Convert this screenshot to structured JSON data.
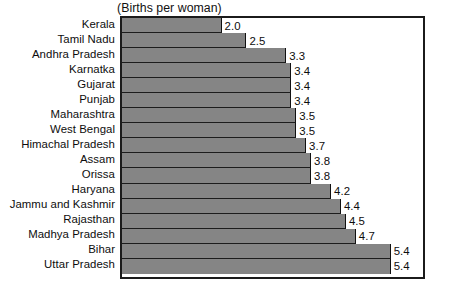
{
  "chart_data": {
    "type": "bar",
    "orientation": "horizontal",
    "title": "",
    "subtitle": "(Births per woman)",
    "xlabel": "",
    "ylabel": "",
    "xlim": [
      0,
      6.05
    ],
    "grid": false,
    "legend": null,
    "bar_color": "#858585",
    "frame_color": "#1b1b1b",
    "background_color": "#ffffff",
    "data_labels_shown": true,
    "axis_tick_labels_shown": false,
    "categories": [
      "Kerala",
      "Tamil Nadu",
      "Andhra Pradesh",
      "Karnatka",
      "Gujarat",
      "Punjab",
      "Maharashtra",
      "West Bengal",
      "Himachal Pradesh",
      "Assam",
      "Orissa",
      "Haryana",
      "Jammu and Kashmir",
      "Rajasthan",
      "Madhya Pradesh",
      "Bihar",
      "Uttar Pradesh"
    ],
    "values": [
      2.0,
      2.5,
      3.3,
      3.4,
      3.4,
      3.4,
      3.5,
      3.5,
      3.7,
      3.8,
      3.8,
      4.2,
      4.4,
      4.5,
      4.7,
      5.4,
      5.4
    ],
    "value_labels": [
      "2.0",
      "2.5",
      "3.3",
      "3.4",
      "3.4",
      "3.4",
      "3.5",
      "3.5",
      "3.7",
      "3.8",
      "3.8",
      "4.2",
      "4.4",
      "4.5",
      "4.7",
      "5.4",
      "5.4"
    ]
  }
}
